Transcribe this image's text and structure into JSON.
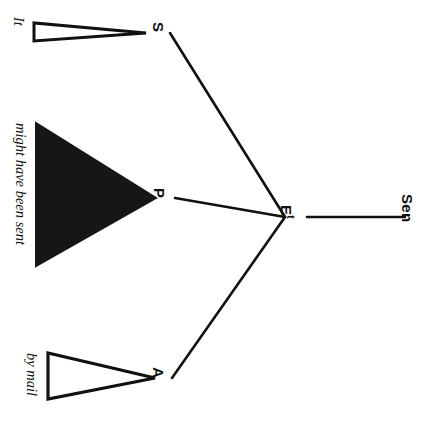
{
  "diagram": {
    "type": "syntax-tree",
    "orientation": "rotated-90-clockwise",
    "background_color": "#ffffff",
    "ink_color": "#111111",
    "nodes": {
      "root": {
        "label": "E",
        "superscript": "t"
      },
      "subject": {
        "label": "S"
      },
      "predicate": {
        "label": "P"
      },
      "adjunct": {
        "label": "A"
      },
      "sentence": {
        "label": "Sen"
      }
    },
    "leaves": [
      {
        "id": "leaf-subject",
        "text": "It",
        "triangle": "outline-thin"
      },
      {
        "id": "leaf-predicate",
        "text": "might have been sent",
        "triangle": "solid-filled"
      },
      {
        "id": "leaf-adjunct",
        "text": "by mail",
        "triangle": "outline"
      }
    ],
    "edges": [
      {
        "from": "E",
        "to": "S"
      },
      {
        "from": "E",
        "to": "P"
      },
      {
        "from": "E",
        "to": "A"
      },
      {
        "from": "E",
        "to": "Sen"
      }
    ]
  }
}
